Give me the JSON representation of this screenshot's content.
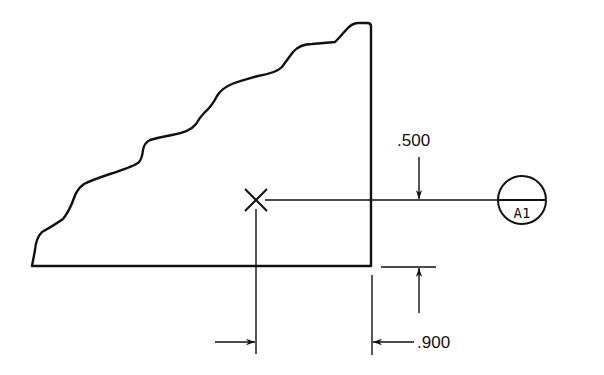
{
  "diagram": {
    "type": "engineering-dimension-drawing",
    "colors": {
      "line": "#111111",
      "background": "#ffffff"
    },
    "part_outline": {
      "shape": "broken-edge-triangle-like-profile"
    },
    "reference_point": {
      "symbol": "X",
      "icon": "cross-mark-icon"
    },
    "dimensions": {
      "vertical": {
        "label": ".500"
      },
      "horizontal": {
        "label": ".900"
      }
    },
    "datum_bubble": {
      "top": "",
      "bottom": "A1"
    }
  }
}
